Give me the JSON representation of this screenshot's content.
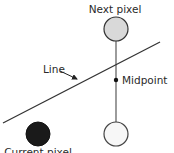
{
  "diagram": {
    "type": "midpoint-line-algorithm",
    "labels": {
      "next_pixel": "Next pixel",
      "current_pixel": "Current pixel",
      "midpoint": "Midpoint",
      "line": "Line"
    },
    "colors": {
      "current_pixel_fill": "#1a1a1a",
      "next_pixel_fill": "#d9d9d9",
      "lower_candidate_fill": "#f7f7f7",
      "stroke": "#333333",
      "connector": "#666666"
    },
    "nodes": [
      {
        "id": "next-pixel",
        "label": "Next pixel",
        "cx": 116,
        "cy": 29,
        "r": 12,
        "fill": "light-gray"
      },
      {
        "id": "lower-candidate",
        "label": "",
        "cx": 116,
        "cy": 134,
        "r": 12,
        "fill": "white"
      },
      {
        "id": "current-pixel",
        "label": "Current pixel",
        "cx": 38,
        "cy": 134,
        "r": 12,
        "fill": "black"
      },
      {
        "id": "midpoint",
        "label": "Midpoint",
        "cx": 116,
        "cy": 80,
        "r": 2
      }
    ],
    "edges": [
      {
        "from": "next-pixel",
        "to": "lower-candidate",
        "style": "vertical-connector"
      },
      {
        "id": "line",
        "label": "Line",
        "x1": 3,
        "y1": 123,
        "x2": 160,
        "y2": 42
      }
    ]
  }
}
